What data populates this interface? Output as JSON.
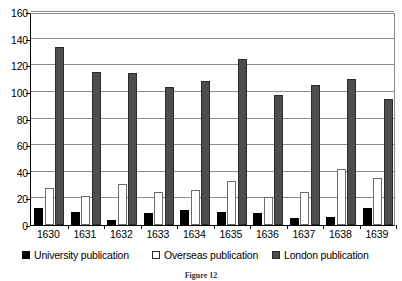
{
  "chart_data": {
    "type": "bar",
    "title": "",
    "xlabel": "",
    "ylabel": "",
    "ylim": [
      0,
      160
    ],
    "yticks": [
      0,
      20,
      40,
      60,
      80,
      100,
      120,
      140,
      160
    ],
    "grid": true,
    "legend_position": "bottom",
    "categories": [
      "1630",
      "1631",
      "1632",
      "1633",
      "1634",
      "1635",
      "1636",
      "1637",
      "1638",
      "1639"
    ],
    "series": [
      {
        "name": "University publication",
        "color": "#000000",
        "values": [
          13,
          10,
          4,
          9,
          11,
          10,
          9,
          5,
          6,
          13
        ]
      },
      {
        "name": "Overseas publication",
        "color": "#ffffff",
        "values": [
          28,
          22,
          31,
          25,
          26,
          33,
          21,
          25,
          42,
          35
        ]
      },
      {
        "name": "London publication",
        "color": "#4d4d4d",
        "values": [
          134,
          115,
          114,
          104,
          108,
          125,
          98,
          105,
          110,
          95
        ]
      }
    ]
  },
  "caption": "Figure 12"
}
